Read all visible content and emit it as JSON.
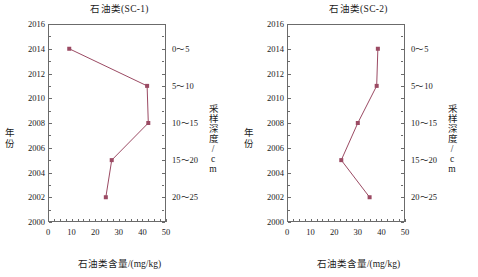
{
  "figure": {
    "panels": [
      {
        "id": "sc-1",
        "title": "石油类(SC-1)",
        "xlabel": "石油类含量/(mg/kg)",
        "ylabel": "年份",
        "y2label": "采样深度/cm"
      },
      {
        "id": "sc-2",
        "title": "石油类(SC-2)",
        "xlabel": "石油类含量/(mg/kg)",
        "ylabel": "年份",
        "y2label": "采样深度/cm"
      }
    ],
    "xticks": [
      "0",
      "10",
      "20",
      "30",
      "40",
      "50"
    ],
    "yticks": [
      "2000",
      "2002",
      "2004",
      "2006",
      "2008",
      "2010",
      "2012",
      "2014",
      "2016"
    ],
    "depth_ticks": [
      "0～5",
      "5～10",
      "10～15",
      "15～20",
      "20～25"
    ],
    "accent_color": "#9b4a63"
  },
  "chart_data": [
    {
      "type": "line",
      "title": "石油类(SC-1)",
      "xlabel": "石油类含量/(mg/kg)",
      "ylabel": "年份",
      "y2label": "采样深度/cm",
      "xlim": [
        0,
        50
      ],
      "ylim": [
        2000,
        2016
      ],
      "xticks": [
        0,
        10,
        20,
        30,
        40,
        50
      ],
      "yticks": [
        2000,
        2002,
        2004,
        2006,
        2008,
        2010,
        2012,
        2014,
        2016
      ],
      "y2_tick_values": [
        2014,
        2011,
        2008,
        2005,
        2002
      ],
      "y2_tick_labels": [
        "0～5",
        "5～10",
        "10～15",
        "15～20",
        "20～25"
      ],
      "grid": false,
      "legend": "none",
      "marker": "square",
      "color": "#9b4a63",
      "x": [
        9.0,
        42.0,
        42.5,
        27.0,
        24.5
      ],
      "y": [
        2014,
        2011,
        2008,
        2005,
        2002
      ],
      "points": [
        {
          "year": 2014,
          "depth": "0～5",
          "value": 9.0
        },
        {
          "year": 2011,
          "depth": "5～10",
          "value": 42.0
        },
        {
          "year": 2008,
          "depth": "10～15",
          "value": 42.5
        },
        {
          "year": 2005,
          "depth": "15～20",
          "value": 27.0
        },
        {
          "year": 2002,
          "depth": "20～25",
          "value": 24.5
        }
      ]
    },
    {
      "type": "line",
      "title": "石油类(SC-2)",
      "xlabel": "石油类含量/(mg/kg)",
      "ylabel": "年份",
      "y2label": "采样深度/cm",
      "xlim": [
        0,
        50
      ],
      "ylim": [
        2000,
        2016
      ],
      "xticks": [
        0,
        10,
        20,
        30,
        40,
        50
      ],
      "yticks": [
        2000,
        2002,
        2004,
        2006,
        2008,
        2010,
        2012,
        2014,
        2016
      ],
      "y2_tick_values": [
        2014,
        2011,
        2008,
        2005,
        2002
      ],
      "y2_tick_labels": [
        "0～5",
        "5～10",
        "10～15",
        "15～20",
        "20～25"
      ],
      "grid": false,
      "legend": "none",
      "marker": "square",
      "color": "#9b4a63",
      "x": [
        38.5,
        38.0,
        30.0,
        23.0,
        35.0
      ],
      "y": [
        2014,
        2011,
        2008,
        2005,
        2002
      ],
      "points": [
        {
          "year": 2014,
          "depth": "0～5",
          "value": 38.5
        },
        {
          "year": 2011,
          "depth": "5～10",
          "value": 38.0
        },
        {
          "year": 2008,
          "depth": "10～15",
          "value": 30.0
        },
        {
          "year": 2005,
          "depth": "15～20",
          "value": 23.0
        },
        {
          "year": 2002,
          "depth": "20～25",
          "value": 35.0
        }
      ]
    }
  ]
}
